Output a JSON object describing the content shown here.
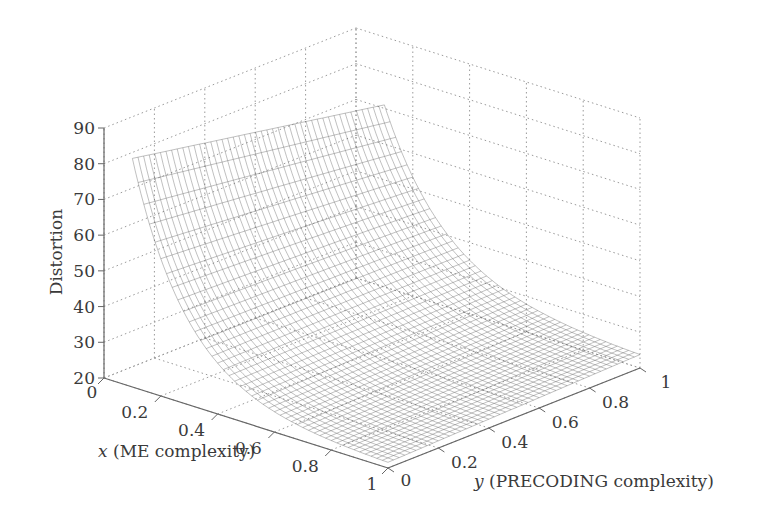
{
  "chart_data": {
    "type": "surface",
    "title": "",
    "xlabel": "x (ME complexity)",
    "xlabel_var": "x",
    "xlabel_rest": " (ME complexity)",
    "ylabel": "y (PRECODING complexity)",
    "ylabel_var": "y",
    "ylabel_rest": " (PRECODING complexity)",
    "zlabel": "Distortion",
    "xlim": [
      0,
      1
    ],
    "ylim": [
      0,
      1
    ],
    "zlim": [
      20,
      90
    ],
    "x_ticks": [
      "0",
      "0.2",
      "0.4",
      "0.6",
      "0.8",
      "1"
    ],
    "y_ticks": [
      "0",
      "0.2",
      "0.4",
      "0.6",
      "0.8",
      "1"
    ],
    "z_ticks": [
      "20",
      "30",
      "40",
      "50",
      "60",
      "70",
      "80",
      "90"
    ],
    "grid": true,
    "style": "wireframe mesh",
    "surface_samples": {
      "x_start": 0.1,
      "description": "Distortion decreases steeply with x; smaller decrease with y",
      "points": [
        {
          "x": 0.1,
          "y": 0.0,
          "z": 83
        },
        {
          "x": 0.1,
          "y": 1.0,
          "z": 65
        },
        {
          "x": 0.3,
          "y": 0.0,
          "z": 45
        },
        {
          "x": 0.3,
          "y": 1.0,
          "z": 38
        },
        {
          "x": 0.5,
          "y": 0.0,
          "z": 32
        },
        {
          "x": 0.5,
          "y": 1.0,
          "z": 30
        },
        {
          "x": 1.0,
          "y": 0.0,
          "z": 22
        },
        {
          "x": 1.0,
          "y": 1.0,
          "z": 25
        }
      ]
    }
  },
  "colors": {
    "axis": "#666666",
    "grid": "#9a9a9a",
    "mesh": "#555555",
    "text": "#3a3a3a"
  }
}
